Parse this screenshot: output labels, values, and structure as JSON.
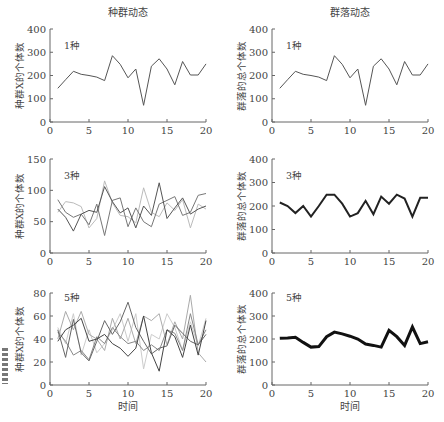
{
  "figure": {
    "column_titles": [
      "种群动态",
      "群落动态"
    ],
    "x_axis_label": "时间"
  },
  "chart_data": [
    {
      "type": "line",
      "panel": "top-left",
      "title": "种群动态",
      "annotation": "1种",
      "ylabel": "种群X的个体数",
      "xlabel": "",
      "xlim": [
        0,
        20
      ],
      "ylim": [
        0,
        400
      ],
      "xticks": [
        0,
        5,
        10,
        15,
        20
      ],
      "yticks": [
        0,
        100,
        200,
        300,
        400
      ],
      "x": [
        1,
        2,
        3,
        4,
        5,
        6,
        7,
        8,
        9,
        10,
        11,
        12,
        13,
        14,
        15,
        16,
        17,
        18,
        19,
        20
      ],
      "series": [
        {
          "name": "种群1",
          "color": "#555555",
          "width": 1,
          "values": [
            145,
            182,
            218,
            205,
            200,
            193,
            178,
            285,
            248,
            190,
            228,
            72,
            240,
            272,
            228,
            160,
            260,
            202,
            202,
            250
          ]
        }
      ]
    },
    {
      "type": "line",
      "panel": "top-right",
      "title": "群落动态",
      "annotation": "1种",
      "ylabel": "群落的总个体数",
      "xlabel": "",
      "xlim": [
        0,
        20
      ],
      "ylim": [
        0,
        400
      ],
      "xticks": [
        0,
        5,
        10,
        15,
        20
      ],
      "yticks": [
        0,
        100,
        200,
        300,
        400
      ],
      "x": [
        1,
        2,
        3,
        4,
        5,
        6,
        7,
        8,
        9,
        10,
        11,
        12,
        13,
        14,
        15,
        16,
        17,
        18,
        19,
        20
      ],
      "series": [
        {
          "name": "群落总数",
          "color": "#555555",
          "width": 1,
          "values": [
            145,
            182,
            218,
            205,
            200,
            193,
            178,
            285,
            248,
            190,
            228,
            72,
            240,
            272,
            228,
            160,
            260,
            202,
            202,
            250
          ]
        }
      ]
    },
    {
      "type": "line",
      "panel": "middle-left",
      "title": "",
      "annotation": "3种",
      "ylabel": "种群X的个体数",
      "xlabel": "",
      "xlim": [
        0,
        20
      ],
      "ylim": [
        0,
        150
      ],
      "xticks": [
        0,
        5,
        10,
        15,
        20
      ],
      "yticks": [
        0,
        50,
        100,
        150
      ],
      "x": [
        1,
        2,
        3,
        4,
        5,
        6,
        7,
        8,
        9,
        10,
        11,
        12,
        13,
        14,
        15,
        16,
        17,
        18,
        19,
        20
      ],
      "series": [
        {
          "name": "种群A",
          "color": "#555555",
          "width": 1,
          "values": [
            70,
            57,
            35,
            62,
            68,
            65,
            106,
            82,
            64,
            72,
            40,
            75,
            60,
            112,
            55,
            72,
            88,
            62,
            70,
            75
          ]
        },
        {
          "name": "种群B",
          "color": "#777777",
          "width": 1,
          "values": [
            85,
            65,
            57,
            62,
            45,
            78,
            28,
            84,
            88,
            42,
            72,
            50,
            42,
            78,
            84,
            90,
            60,
            65,
            92,
            95
          ]
        },
        {
          "name": "种群C",
          "color": "#bbbbbb",
          "width": 1,
          "values": [
            65,
            82,
            80,
            74,
            40,
            55,
            115,
            80,
            60,
            58,
            48,
            104,
            65,
            58,
            80,
            68,
            85,
            40,
            78,
            70
          ]
        }
      ]
    },
    {
      "type": "line",
      "panel": "middle-right",
      "title": "",
      "annotation": "3种",
      "ylabel": "群落的总个体数",
      "xlabel": "",
      "xlim": [
        0,
        20
      ],
      "ylim": [
        0,
        400
      ],
      "xticks": [
        0,
        5,
        10,
        15,
        20
      ],
      "yticks": [
        0,
        100,
        200,
        300,
        400
      ],
      "x": [
        1,
        2,
        3,
        4,
        5,
        6,
        7,
        8,
        9,
        10,
        11,
        12,
        13,
        14,
        15,
        16,
        17,
        18,
        19,
        20
      ],
      "series": [
        {
          "name": "群落总数",
          "color": "#222222",
          "width": 2,
          "values": [
            215,
            200,
            170,
            200,
            155,
            200,
            248,
            248,
            210,
            155,
            170,
            222,
            165,
            240,
            210,
            248,
            232,
            155,
            235,
            235
          ]
        }
      ]
    },
    {
      "type": "line",
      "panel": "bottom-left",
      "title": "",
      "annotation": "5种",
      "ylabel": "种群X的个体数",
      "xlabel": "时间",
      "xlim": [
        0,
        20
      ],
      "ylim": [
        0,
        80
      ],
      "xticks": [
        0,
        5,
        10,
        15,
        20
      ],
      "yticks": [
        0,
        20,
        40,
        60,
        80
      ],
      "x": [
        1,
        2,
        3,
        4,
        5,
        6,
        7,
        8,
        9,
        10,
        11,
        12,
        13,
        14,
        15,
        16,
        17,
        18,
        19,
        20
      ],
      "series": [
        {
          "name": "种群A",
          "color": "#444444",
          "width": 1,
          "values": [
            38,
            48,
            52,
            58,
            38,
            40,
            44,
            36,
            32,
            25,
            32,
            60,
            28,
            12,
            48,
            42,
            24,
            52,
            26,
            56
          ]
        },
        {
          "name": "种群B",
          "color": "#666666",
          "width": 1,
          "values": [
            48,
            24,
            57,
            28,
            21,
            38,
            56,
            44,
            55,
            72,
            50,
            38,
            27,
            32,
            34,
            52,
            45,
            38,
            35,
            44
          ]
        },
        {
          "name": "种群C",
          "color": "#888888",
          "width": 1,
          "values": [
            46,
            38,
            26,
            30,
            22,
            42,
            36,
            50,
            42,
            36,
            38,
            30,
            35,
            30,
            48,
            45,
            30,
            62,
            35,
            48
          ]
        },
        {
          "name": "种群D",
          "color": "#aaaaaa",
          "width": 1,
          "values": [
            40,
            64,
            48,
            64,
            44,
            40,
            30,
            58,
            40,
            58,
            36,
            60,
            56,
            62,
            35,
            55,
            40,
            78,
            28,
            20
          ]
        },
        {
          "name": "种群E",
          "color": "#cccccc",
          "width": 1,
          "values": [
            50,
            36,
            62,
            26,
            48,
            28,
            36,
            48,
            62,
            38,
            62,
            14,
            44,
            40,
            62,
            50,
            30,
            55,
            34,
            58
          ]
        }
      ]
    },
    {
      "type": "line",
      "panel": "bottom-right",
      "title": "",
      "annotation": "5种",
      "ylabel": "群落的总个体数",
      "xlabel": "时间",
      "xlim": [
        0,
        20
      ],
      "ylim": [
        0,
        400
      ],
      "xticks": [
        0,
        5,
        10,
        15,
        20
      ],
      "yticks": [
        0,
        100,
        200,
        300,
        400
      ],
      "x": [
        1,
        2,
        3,
        4,
        5,
        6,
        7,
        8,
        9,
        10,
        11,
        12,
        13,
        14,
        15,
        16,
        17,
        18,
        19,
        20
      ],
      "series": [
        {
          "name": "群落总数",
          "color": "#111111",
          "width": 3,
          "values": [
            203,
            205,
            208,
            185,
            165,
            167,
            210,
            230,
            222,
            212,
            200,
            178,
            172,
            165,
            238,
            210,
            172,
            252,
            180,
            188
          ]
        }
      ]
    }
  ]
}
